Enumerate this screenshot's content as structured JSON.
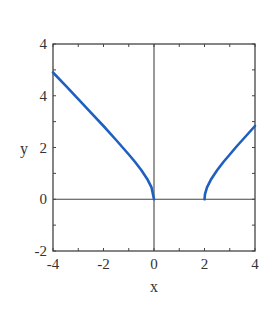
{
  "chart_data": {
    "type": "line",
    "title": "",
    "xlabel": "x",
    "ylabel": "y",
    "xlim": [
      -4,
      4
    ],
    "ylim": [
      -2,
      6
    ],
    "x_ticks": [
      -4,
      -2,
      0,
      2,
      4
    ],
    "x_tick_labels": [
      "-4",
      "-2",
      "0",
      "2",
      "4"
    ],
    "y_ticks": [
      -2,
      0,
      2,
      4,
      6
    ],
    "y_tick_labels": [
      "-2",
      "0",
      "2",
      "4",
      "4"
    ],
    "grid": false,
    "zero_lines": {
      "x0": true,
      "y0": true
    },
    "line_color": "#1f5fbf",
    "series": [
      {
        "name": "left branch",
        "x": [
          -4,
          -3.5,
          -3,
          -2.5,
          -2,
          -1.5,
          -1,
          -0.75,
          -0.5,
          -0.25,
          -0.1,
          0
        ],
        "values": [
          4.9,
          4.39,
          3.87,
          3.35,
          2.83,
          2.29,
          1.73,
          1.44,
          1.12,
          0.75,
          0.46,
          0
        ]
      },
      {
        "name": "right branch",
        "x": [
          2,
          2.02,
          2.1,
          2.25,
          2.5,
          2.75,
          3,
          3.25,
          3.5,
          3.75,
          4
        ],
        "values": [
          0,
          0.2,
          0.46,
          0.75,
          1.12,
          1.44,
          1.73,
          2.02,
          2.29,
          2.56,
          2.83
        ]
      }
    ]
  }
}
